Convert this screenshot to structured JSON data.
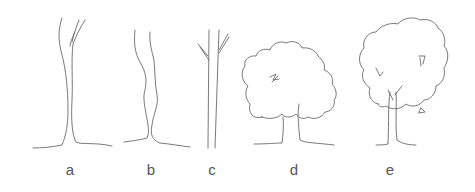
{
  "figure": {
    "stroke_color": "#6a6a6a",
    "items": [
      {
        "label": "a",
        "kind": "trunk with fork"
      },
      {
        "label": "b",
        "kind": "irregular trunk"
      },
      {
        "label": "c",
        "kind": "straight trunk with branches"
      },
      {
        "label": "d",
        "kind": "tree with rounded crown, split trunk"
      },
      {
        "label": "e",
        "kind": "tree with tall crown, forked trunk"
      }
    ]
  }
}
